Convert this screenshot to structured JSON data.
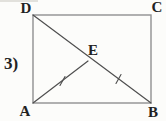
{
  "colors": {
    "paper": "#fcfcfa",
    "edge": "#909090",
    "seg": "#4f4f4f",
    "ink": "#222222",
    "artifact": "#d8d6d0"
  },
  "problem_number": {
    "text": "3)",
    "x": 11,
    "y": 69
  },
  "diagram": {
    "rect": {
      "x": 33,
      "y": 15,
      "width": 118,
      "height": 88
    },
    "points": {
      "A": {
        "x": 33,
        "y": 103
      },
      "B": {
        "x": 151,
        "y": 103
      },
      "C": {
        "x": 151,
        "y": 15
      },
      "D": {
        "x": 33,
        "y": 15
      },
      "E": {
        "x": 88,
        "y": 61
      }
    },
    "segments": {
      "DB": {
        "x1": 33,
        "y1": 15,
        "x2": 151,
        "y2": 103
      },
      "AE": {
        "x1": 33,
        "y1": 103,
        "x2": 88,
        "y2": 61
      }
    },
    "ticks": {
      "AE": {
        "x1": 65,
        "y1": 76.5,
        "x2": 60,
        "y2": 85.5
      },
      "EB": {
        "x1": 121,
        "y1": 74.5,
        "x2": 116,
        "y2": 83.5
      }
    },
    "labels": {
      "D": {
        "text": "D",
        "x": 26,
        "y": 13
      },
      "C": {
        "text": "C",
        "x": 157,
        "y": 12
      },
      "A": {
        "text": "A",
        "x": 25,
        "y": 116
      },
      "B": {
        "text": "B",
        "x": 153,
        "y": 117
      },
      "E": {
        "text": "E",
        "x": 93,
        "y": 55
      }
    },
    "artifact": {
      "x1": 0,
      "y1": 1,
      "x2": 38,
      "y2": 1
    }
  }
}
